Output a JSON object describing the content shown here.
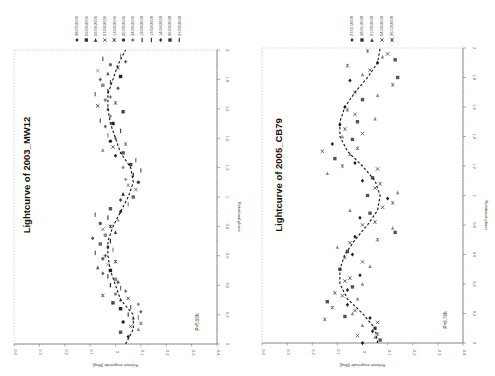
{
  "page": {
    "orientation": "rotated 90deg clockwise"
  },
  "charts": [
    {
      "title": "Lightcurve of 2003_MW12",
      "period_label": "P=5.90h",
      "xlabel": "Rotational phase",
      "ylabel": "Relative magnitude [Mag]",
      "legend": [
        "28/05/2006",
        "09/06/2006",
        "06/06/2006",
        "07/06/2006",
        "13/06/2006",
        "25/06/2006",
        "24/06/2006",
        "12/04/2008",
        "13/04/2008",
        "14/04/2008",
        "26/04/2008",
        "27/04/2008"
      ]
    },
    {
      "title": "Lightcurve of 2005_CB79",
      "period_label": "P=6.76h",
      "xlabel": "Rotational phase",
      "ylabel": "Relative magnitude [Mag]",
      "legend": [
        "27/01/2008",
        "28/01/2008",
        "01/06/2008",
        "04/06/2008",
        "26/12/2008"
      ]
    }
  ],
  "chart_data": [
    {
      "type": "scatter",
      "title": "Lightcurve of 2003_MW12",
      "xlabel": "Rotational phase",
      "ylabel": "Relative magnitude [Mag]",
      "xlim": [
        0,
        2
      ],
      "ylim": [
        0.4,
        -0.4
      ],
      "x_ticks": [
        0,
        0.2,
        0.4,
        0.6,
        0.8,
        1,
        1.2,
        1.4,
        1.6,
        1.8,
        2
      ],
      "y_ticks": [
        0.4,
        0.3,
        0.2,
        0.1,
        0,
        -0.1,
        -0.2,
        -0.3,
        -0.4
      ],
      "annotation": "P=5.90h",
      "legend_position": "right",
      "fit_curve": {
        "style": "dashed",
        "x": [
          0,
          0.1,
          0.2,
          0.3,
          0.4,
          0.5,
          0.6,
          0.7,
          0.8,
          0.9,
          1.0,
          1.1,
          1.2,
          1.3,
          1.4,
          1.5,
          1.6,
          1.7,
          1.8,
          1.9,
          2.0
        ],
        "y": [
          -0.04,
          -0.07,
          -0.07,
          -0.02,
          0.0,
          0.02,
          0.03,
          0.03,
          0.01,
          -0.02,
          -0.05,
          -0.07,
          -0.06,
          -0.02,
          0.0,
          0.02,
          0.03,
          0.03,
          0.01,
          -0.01,
          -0.04
        ]
      },
      "series_points": [
        [
          0.05,
          -0.05
        ],
        [
          0.08,
          -0.02
        ],
        [
          0.1,
          -0.09
        ],
        [
          0.12,
          -0.06
        ],
        [
          0.14,
          -0.1
        ],
        [
          0.15,
          -0.03
        ],
        [
          0.17,
          -0.07
        ],
        [
          0.18,
          -0.09
        ],
        [
          0.2,
          -0.05
        ],
        [
          0.22,
          -0.1
        ],
        [
          0.24,
          -0.02
        ],
        [
          0.25,
          -0.06
        ],
        [
          0.27,
          -0.09
        ],
        [
          0.28,
          0.01
        ],
        [
          0.3,
          -0.02
        ],
        [
          0.31,
          -0.05
        ],
        [
          0.33,
          0.05
        ],
        [
          0.34,
          0.0
        ],
        [
          0.36,
          -0.04
        ],
        [
          0.38,
          -0.02
        ],
        [
          0.4,
          0.02
        ],
        [
          0.42,
          -0.01
        ],
        [
          0.44,
          0.0
        ],
        [
          0.46,
          0.03
        ],
        [
          0.48,
          0.05
        ],
        [
          0.5,
          0.02
        ],
        [
          0.52,
          0.07
        ],
        [
          0.54,
          0.03
        ],
        [
          0.56,
          0.0
        ],
        [
          0.58,
          0.05
        ],
        [
          0.6,
          0.04
        ],
        [
          0.62,
          0.08
        ],
        [
          0.64,
          0.01
        ],
        [
          0.66,
          0.03
        ],
        [
          0.68,
          0.06
        ],
        [
          0.7,
          0.02
        ],
        [
          0.72,
          0.09
        ],
        [
          0.74,
          0.04
        ],
        [
          0.76,
          0.0
        ],
        [
          0.78,
          0.05
        ],
        [
          0.8,
          0.02
        ],
        [
          0.82,
          0.06
        ],
        [
          0.84,
          -0.01
        ],
        [
          0.86,
          0.03
        ],
        [
          0.88,
          0.08
        ],
        [
          0.9,
          -0.02
        ],
        [
          0.92,
          0.02
        ],
        [
          0.95,
          -0.05
        ],
        [
          0.98,
          -0.02
        ],
        [
          1.0,
          -0.07
        ],
        [
          1.02,
          -0.03
        ],
        [
          1.05,
          -0.08
        ],
        [
          1.08,
          -0.05
        ],
        [
          1.1,
          -0.09
        ],
        [
          1.12,
          -0.04
        ],
        [
          1.15,
          -0.07
        ],
        [
          1.18,
          -0.1
        ],
        [
          1.2,
          -0.03
        ],
        [
          1.22,
          -0.06
        ],
        [
          1.25,
          -0.08
        ],
        [
          1.28,
          0.0
        ],
        [
          1.3,
          -0.03
        ],
        [
          1.32,
          0.05
        ],
        [
          1.34,
          0.01
        ],
        [
          1.36,
          -0.04
        ],
        [
          1.38,
          0.02
        ],
        [
          1.4,
          0.0
        ],
        [
          1.42,
          0.03
        ],
        [
          1.45,
          -0.02
        ],
        [
          1.48,
          0.04
        ],
        [
          1.5,
          0.01
        ],
        [
          1.52,
          0.06
        ],
        [
          1.55,
          0.02
        ],
        [
          1.58,
          -0.03
        ],
        [
          1.6,
          0.03
        ],
        [
          1.62,
          0.07
        ],
        [
          1.64,
          0.0
        ],
        [
          1.66,
          0.04
        ],
        [
          1.68,
          0.02
        ],
        [
          1.7,
          0.08
        ],
        [
          1.72,
          0.03
        ],
        [
          1.74,
          -0.01
        ],
        [
          1.76,
          0.05
        ],
        [
          1.78,
          0.02
        ],
        [
          1.8,
          0.06
        ],
        [
          1.82,
          -0.02
        ],
        [
          1.84,
          0.03
        ],
        [
          1.86,
          0.07
        ],
        [
          1.88,
          -0.01
        ],
        [
          1.9,
          0.02
        ],
        [
          1.92,
          -0.04
        ],
        [
          1.94,
          0.05
        ],
        [
          1.96,
          -0.02
        ]
      ]
    },
    {
      "type": "scatter",
      "title": "Lightcurve of 2005_CB79",
      "xlabel": "Rotational phase",
      "ylabel": "Relative magnitude [Mag]",
      "xlim": [
        0,
        2
      ],
      "ylim": [
        0.4,
        -0.4
      ],
      "x_ticks": [
        0,
        0.2,
        0.4,
        0.6,
        0.8,
        1,
        1.2,
        1.4,
        1.6,
        1.8,
        2
      ],
      "y_ticks": [
        0.4,
        0.3,
        0.2,
        0.1,
        0,
        -0.1,
        -0.2,
        -0.3,
        -0.4
      ],
      "annotation": "P=6.76h",
      "legend_position": "right",
      "fit_curve": {
        "style": "dashed",
        "x": [
          0,
          0.1,
          0.2,
          0.3,
          0.4,
          0.5,
          0.6,
          0.7,
          0.8,
          0.9,
          1.0,
          1.1,
          1.2,
          1.3,
          1.4,
          1.5,
          1.6,
          1.7,
          1.8,
          1.9,
          2.0
        ],
        "y": [
          -0.06,
          -0.05,
          0.0,
          0.06,
          0.09,
          0.09,
          0.07,
          0.03,
          -0.02,
          -0.06,
          -0.07,
          -0.05,
          0.0,
          0.06,
          0.09,
          0.09,
          0.07,
          0.03,
          -0.02,
          -0.06,
          -0.07
        ]
      },
      "series_points": [
        [
          0.0,
          0.0
        ],
        [
          0.02,
          -0.07
        ],
        [
          0.04,
          -0.05
        ],
        [
          0.05,
          0.02
        ],
        [
          0.06,
          -0.06
        ],
        [
          0.08,
          -0.04
        ],
        [
          0.1,
          -0.05
        ],
        [
          0.12,
          0.0
        ],
        [
          0.14,
          -0.06
        ],
        [
          0.16,
          0.15
        ],
        [
          0.17,
          -0.03
        ],
        [
          0.18,
          0.07
        ],
        [
          0.2,
          0.04
        ],
        [
          0.22,
          0.03
        ],
        [
          0.24,
          0.12
        ],
        [
          0.26,
          0.06
        ],
        [
          0.28,
          0.14
        ],
        [
          0.3,
          0.02
        ],
        [
          0.32,
          0.08
        ],
        [
          0.34,
          0.11
        ],
        [
          0.36,
          0.06
        ],
        [
          0.38,
          0.04
        ],
        [
          0.4,
          0.0
        ],
        [
          0.42,
          0.07
        ],
        [
          0.44,
          0.05
        ],
        [
          0.46,
          0.01
        ],
        [
          0.5,
          0.09
        ],
        [
          0.52,
          -0.03
        ],
        [
          0.55,
          0.0
        ],
        [
          0.58,
          0.07
        ],
        [
          0.6,
          0.04
        ],
        [
          0.62,
          0.06
        ],
        [
          0.65,
          0.1
        ],
        [
          0.68,
          0.05
        ],
        [
          0.7,
          -0.06
        ],
        [
          0.72,
          0.03
        ],
        [
          0.75,
          -0.13
        ],
        [
          0.78,
          -0.12
        ],
        [
          0.8,
          0.0
        ],
        [
          0.82,
          -0.05
        ],
        [
          0.85,
          0.01
        ],
        [
          0.88,
          -0.03
        ],
        [
          0.9,
          0.05
        ],
        [
          0.92,
          -0.08
        ],
        [
          0.95,
          -0.12
        ],
        [
          0.98,
          -0.1
        ],
        [
          1.0,
          -0.02
        ],
        [
          1.02,
          -0.14
        ],
        [
          1.05,
          -0.05
        ],
        [
          1.08,
          -0.07
        ],
        [
          1.1,
          0.0
        ],
        [
          1.12,
          -0.04
        ],
        [
          1.15,
          0.14
        ],
        [
          1.18,
          -0.06
        ],
        [
          1.2,
          0.08
        ],
        [
          1.22,
          0.03
        ],
        [
          1.25,
          0.11
        ],
        [
          1.28,
          0.05
        ],
        [
          1.3,
          0.16
        ],
        [
          1.32,
          0.02
        ],
        [
          1.35,
          0.12
        ],
        [
          1.38,
          0.04
        ],
        [
          1.4,
          0.08
        ],
        [
          1.42,
          0.0
        ],
        [
          1.45,
          0.07
        ],
        [
          1.48,
          0.09
        ],
        [
          1.5,
          0.02
        ],
        [
          1.52,
          -0.05
        ],
        [
          1.55,
          0.03
        ],
        [
          1.58,
          0.06
        ],
        [
          1.6,
          0.07
        ],
        [
          1.65,
          0.0
        ],
        [
          1.68,
          -0.06
        ],
        [
          1.7,
          0.03
        ],
        [
          1.75,
          -0.12
        ],
        [
          1.78,
          0.05
        ],
        [
          1.8,
          -0.14
        ],
        [
          1.82,
          0.0
        ],
        [
          1.85,
          -0.03
        ],
        [
          1.88,
          0.06
        ],
        [
          1.9,
          -0.06
        ],
        [
          1.92,
          -0.13
        ],
        [
          1.94,
          -0.08
        ],
        [
          1.96,
          -0.1
        ],
        [
          1.98,
          -0.02
        ]
      ]
    }
  ]
}
